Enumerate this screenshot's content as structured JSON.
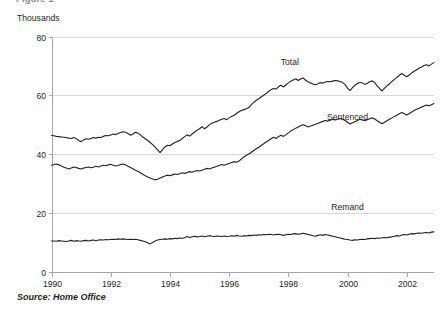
{
  "figure": {
    "title_clipped": "Figure 1",
    "unit_label": "Thousands",
    "source_note": "Source: Home Office"
  },
  "chart_data": {
    "type": "line",
    "title": "",
    "subtitle": "",
    "xlabel": "",
    "ylabel": "Thousands",
    "xlim": [
      1990.0,
      2002.92
    ],
    "ylim": [
      0,
      80
    ],
    "ytick_labels": [
      "0",
      "20",
      "40",
      "60",
      "80"
    ],
    "ytick_values": [
      0,
      20,
      40,
      60,
      80
    ],
    "xtick_labels": [
      "1990",
      "1992",
      "1994",
      "1996",
      "1998",
      "2000",
      "2002"
    ],
    "xtick_values": [
      1990,
      1992,
      1994,
      1996,
      1998,
      2000,
      2002
    ],
    "grid": "horizontal",
    "legend_position": "inline-annotation",
    "annotations": [
      {
        "label": "Total",
        "x": 1998.05,
        "y": 70.2
      },
      {
        "label": "Sentenced",
        "x": 2000.0,
        "y": 51.5
      },
      {
        "label": "Remand",
        "x": 2000.0,
        "y": 21.0
      }
    ],
    "series": [
      {
        "name": "Total",
        "x": [
          1990.0,
          1990.083,
          1990.167,
          1990.25,
          1990.333,
          1990.417,
          1990.5,
          1990.583,
          1990.667,
          1990.75,
          1990.833,
          1990.917,
          1991.0,
          1991.083,
          1991.167,
          1991.25,
          1991.333,
          1991.417,
          1991.5,
          1991.583,
          1991.667,
          1991.75,
          1991.833,
          1991.917,
          1992.0,
          1992.083,
          1992.167,
          1992.25,
          1992.333,
          1992.417,
          1992.5,
          1992.583,
          1992.667,
          1992.75,
          1992.833,
          1992.917,
          1993.0,
          1993.083,
          1993.167,
          1993.25,
          1993.333,
          1993.417,
          1993.5,
          1993.583,
          1993.667,
          1993.75,
          1993.833,
          1993.917,
          1994.0,
          1994.083,
          1994.167,
          1994.25,
          1994.333,
          1994.417,
          1994.5,
          1994.583,
          1994.667,
          1994.75,
          1994.833,
          1994.917,
          1995.0,
          1995.083,
          1995.167,
          1995.25,
          1995.333,
          1995.417,
          1995.5,
          1995.583,
          1995.667,
          1995.75,
          1995.833,
          1995.917,
          1996.0,
          1996.083,
          1996.167,
          1996.25,
          1996.333,
          1996.417,
          1996.5,
          1996.583,
          1996.667,
          1996.75,
          1996.833,
          1996.917,
          1997.0,
          1997.083,
          1997.167,
          1997.25,
          1997.333,
          1997.417,
          1997.5,
          1997.583,
          1997.667,
          1997.75,
          1997.833,
          1997.917,
          1998.0,
          1998.083,
          1998.167,
          1998.25,
          1998.333,
          1998.417,
          1998.5,
          1998.583,
          1998.667,
          1998.75,
          1998.833,
          1998.917,
          1999.0,
          1999.083,
          1999.167,
          1999.25,
          1999.333,
          1999.417,
          1999.5,
          1999.583,
          1999.667,
          1999.75,
          1999.833,
          1999.917,
          2000.0,
          2000.083,
          2000.167,
          2000.25,
          2000.333,
          2000.417,
          2000.5,
          2000.583,
          2000.667,
          2000.75,
          2000.833,
          2000.917,
          2001.0,
          2001.083,
          2001.167,
          2001.25,
          2001.333,
          2001.417,
          2001.5,
          2001.583,
          2001.667,
          2001.75,
          2001.833,
          2001.917,
          2002.0,
          2002.083,
          2002.167,
          2002.25,
          2002.333,
          2002.417,
          2002.5,
          2002.583,
          2002.667,
          2002.75,
          2002.833,
          2002.917
        ],
        "y": [
          46.3,
          46.2,
          46.0,
          45.9,
          45.8,
          45.7,
          45.6,
          45.4,
          45.3,
          45.6,
          45.3,
          44.6,
          44.2,
          44.8,
          45.2,
          45.0,
          45.3,
          45.6,
          45.4,
          45.7,
          45.6,
          46.0,
          46.3,
          46.2,
          46.5,
          46.8,
          46.6,
          47.0,
          47.3,
          47.6,
          47.4,
          47.0,
          46.4,
          46.8,
          47.4,
          47.1,
          46.5,
          45.8,
          45.2,
          44.6,
          43.9,
          43.2,
          42.3,
          41.4,
          40.5,
          41.5,
          42.4,
          43.0,
          42.8,
          43.4,
          43.9,
          44.3,
          44.6,
          45.3,
          45.9,
          46.5,
          46.1,
          46.8,
          47.5,
          48.1,
          48.6,
          49.3,
          48.6,
          49.2,
          49.9,
          50.5,
          50.8,
          51.1,
          51.5,
          51.8,
          52.1,
          51.7,
          52.3,
          52.8,
          53.2,
          53.8,
          54.4,
          54.8,
          55.1,
          55.4,
          55.8,
          56.8,
          57.6,
          58.3,
          58.8,
          59.4,
          60.0,
          60.6,
          61.3,
          61.9,
          62.3,
          62.1,
          62.9,
          63.4,
          62.8,
          63.5,
          64.2,
          64.8,
          65.2,
          65.6,
          65.0,
          65.5,
          65.9,
          65.1,
          64.6,
          64.2,
          63.8,
          63.6,
          63.9,
          64.3,
          64.1,
          64.5,
          64.7,
          64.6,
          64.8,
          65.0,
          64.9,
          64.7,
          64.3,
          63.6,
          62.4,
          61.6,
          62.6,
          63.4,
          64.0,
          64.4,
          64.2,
          63.7,
          64.1,
          64.6,
          64.9,
          64.3,
          63.2,
          62.3,
          61.5,
          62.4,
          63.2,
          63.9,
          64.7,
          65.4,
          66.1,
          66.8,
          67.4,
          66.8,
          66.3,
          66.9,
          67.6,
          68.2,
          68.7,
          69.2,
          69.6,
          70.1,
          70.4,
          70.0,
          70.6,
          71.1
        ]
      },
      {
        "name": "Sentenced",
        "x": [
          1990.0,
          1990.083,
          1990.167,
          1990.25,
          1990.333,
          1990.417,
          1990.5,
          1990.583,
          1990.667,
          1990.75,
          1990.833,
          1990.917,
          1991.0,
          1991.083,
          1991.167,
          1991.25,
          1991.333,
          1991.417,
          1991.5,
          1991.583,
          1991.667,
          1991.75,
          1991.833,
          1991.917,
          1992.0,
          1992.083,
          1992.167,
          1992.25,
          1992.333,
          1992.417,
          1992.5,
          1992.583,
          1992.667,
          1992.75,
          1992.833,
          1992.917,
          1993.0,
          1993.083,
          1993.167,
          1993.25,
          1993.333,
          1993.417,
          1993.5,
          1993.583,
          1993.667,
          1993.75,
          1993.833,
          1993.917,
          1994.0,
          1994.083,
          1994.167,
          1994.25,
          1994.333,
          1994.417,
          1994.5,
          1994.583,
          1994.667,
          1994.75,
          1994.833,
          1994.917,
          1995.0,
          1995.083,
          1995.167,
          1995.25,
          1995.333,
          1995.417,
          1995.5,
          1995.583,
          1995.667,
          1995.75,
          1995.833,
          1995.917,
          1996.0,
          1996.083,
          1996.167,
          1996.25,
          1996.333,
          1996.417,
          1996.5,
          1996.583,
          1996.667,
          1996.75,
          1996.833,
          1996.917,
          1997.0,
          1997.083,
          1997.167,
          1997.25,
          1997.333,
          1997.417,
          1997.5,
          1997.583,
          1997.667,
          1997.75,
          1997.833,
          1997.917,
          1998.0,
          1998.083,
          1998.167,
          1998.25,
          1998.333,
          1998.417,
          1998.5,
          1998.583,
          1998.667,
          1998.75,
          1998.833,
          1998.917,
          1999.0,
          1999.083,
          1999.167,
          1999.25,
          1999.333,
          1999.417,
          1999.5,
          1999.583,
          1999.667,
          1999.75,
          1999.833,
          1999.917,
          2000.0,
          2000.083,
          2000.167,
          2000.25,
          2000.333,
          2000.417,
          2000.5,
          2000.583,
          2000.667,
          2000.75,
          2000.833,
          2000.917,
          2001.0,
          2001.083,
          2001.167,
          2001.25,
          2001.333,
          2001.417,
          2001.5,
          2001.583,
          2001.667,
          2001.75,
          2001.833,
          2001.917,
          2002.0,
          2002.083,
          2002.167,
          2002.25,
          2002.333,
          2002.417,
          2002.5,
          2002.583,
          2002.667,
          2002.75,
          2002.833,
          2002.917
        ],
        "y": [
          36.2,
          36.4,
          36.6,
          36.3,
          35.9,
          35.5,
          35.2,
          34.9,
          35.2,
          35.6,
          35.4,
          35.1,
          34.9,
          35.2,
          35.4,
          35.6,
          35.3,
          35.5,
          35.8,
          35.6,
          35.9,
          36.2,
          36.0,
          36.3,
          36.5,
          36.2,
          35.9,
          36.1,
          36.4,
          36.6,
          36.3,
          35.8,
          35.4,
          35.0,
          34.5,
          34.1,
          33.6,
          33.1,
          32.6,
          32.2,
          31.8,
          31.5,
          31.2,
          31.4,
          31.8,
          32.2,
          32.5,
          32.8,
          32.6,
          32.9,
          33.2,
          33.0,
          33.3,
          33.6,
          33.4,
          33.7,
          34.0,
          33.8,
          34.1,
          34.4,
          34.2,
          34.5,
          34.8,
          35.1,
          34.9,
          35.2,
          35.5,
          35.8,
          36.1,
          36.4,
          36.2,
          36.5,
          36.8,
          37.1,
          37.4,
          37.2,
          37.6,
          38.3,
          39.0,
          39.6,
          40.0,
          40.6,
          41.2,
          41.8,
          42.3,
          42.9,
          43.5,
          44.1,
          44.6,
          45.2,
          45.7,
          45.3,
          45.9,
          46.4,
          46.0,
          46.6,
          47.2,
          47.8,
          48.3,
          48.8,
          49.2,
          49.6,
          50.0,
          49.6,
          49.2,
          49.5,
          49.8,
          50.1,
          50.4,
          50.8,
          51.1,
          51.4,
          51.2,
          51.5,
          51.8,
          51.6,
          51.9,
          52.1,
          51.8,
          51.4,
          50.8,
          50.2,
          50.6,
          51.0,
          51.4,
          51.8,
          51.6,
          51.3,
          51.7,
          52.0,
          52.3,
          51.9,
          51.3,
          50.8,
          50.3,
          50.8,
          51.3,
          51.8,
          52.3,
          52.8,
          53.2,
          53.7,
          54.1,
          53.7,
          53.3,
          53.8,
          54.3,
          54.8,
          55.2,
          55.6,
          56.0,
          56.3,
          56.7,
          56.4,
          56.8,
          57.2
        ]
      },
      {
        "name": "Remand",
        "x": [
          1990.0,
          1990.083,
          1990.167,
          1990.25,
          1990.333,
          1990.417,
          1990.5,
          1990.583,
          1990.667,
          1990.75,
          1990.833,
          1990.917,
          1991.0,
          1991.083,
          1991.167,
          1991.25,
          1991.333,
          1991.417,
          1991.5,
          1991.583,
          1991.667,
          1991.75,
          1991.833,
          1991.917,
          1992.0,
          1992.083,
          1992.167,
          1992.25,
          1992.333,
          1992.417,
          1992.5,
          1992.583,
          1992.667,
          1992.75,
          1992.833,
          1992.917,
          1993.0,
          1993.083,
          1993.167,
          1993.25,
          1993.333,
          1993.417,
          1993.5,
          1993.583,
          1993.667,
          1993.75,
          1993.833,
          1993.917,
          1994.0,
          1994.083,
          1994.167,
          1994.25,
          1994.333,
          1994.417,
          1994.5,
          1994.583,
          1994.667,
          1994.75,
          1994.833,
          1994.917,
          1995.0,
          1995.083,
          1995.167,
          1995.25,
          1995.333,
          1995.417,
          1995.5,
          1995.583,
          1995.667,
          1995.75,
          1995.833,
          1995.917,
          1996.0,
          1996.083,
          1996.167,
          1996.25,
          1996.333,
          1996.417,
          1996.5,
          1996.583,
          1996.667,
          1996.75,
          1996.833,
          1996.917,
          1997.0,
          1997.083,
          1997.167,
          1997.25,
          1997.333,
          1997.417,
          1997.5,
          1997.583,
          1997.667,
          1997.75,
          1997.833,
          1997.917,
          1998.0,
          1998.083,
          1998.167,
          1998.25,
          1998.333,
          1998.417,
          1998.5,
          1998.583,
          1998.667,
          1998.75,
          1998.833,
          1998.917,
          1999.0,
          1999.083,
          1999.167,
          1999.25,
          1999.333,
          1999.417,
          1999.5,
          1999.583,
          1999.667,
          1999.75,
          1999.833,
          1999.917,
          2000.0,
          2000.083,
          2000.167,
          2000.25,
          2000.333,
          2000.417,
          2000.5,
          2000.583,
          2000.667,
          2000.75,
          2000.833,
          2000.917,
          2001.0,
          2001.083,
          2001.167,
          2001.25,
          2001.333,
          2001.417,
          2001.5,
          2001.583,
          2001.667,
          2001.75,
          2001.833,
          2001.917,
          2002.0,
          2002.083,
          2002.167,
          2002.25,
          2002.333,
          2002.417,
          2002.5,
          2002.583,
          2002.667,
          2002.75,
          2002.833,
          2002.917
        ],
        "y": [
          10.4,
          10.4,
          10.3,
          10.5,
          10.4,
          10.3,
          10.2,
          10.4,
          10.6,
          10.3,
          10.5,
          10.4,
          10.3,
          10.5,
          10.6,
          10.4,
          10.6,
          10.7,
          10.5,
          10.7,
          10.8,
          10.7,
          10.9,
          10.8,
          10.9,
          11.0,
          10.9,
          11.1,
          11.0,
          11.1,
          11.0,
          10.9,
          11.0,
          10.9,
          11.0,
          10.8,
          10.6,
          10.4,
          10.1,
          9.8,
          9.4,
          9.9,
          10.4,
          10.7,
          10.9,
          11.0,
          11.1,
          11.0,
          11.2,
          11.1,
          11.3,
          11.2,
          11.4,
          11.3,
          11.5,
          11.9,
          11.6,
          11.8,
          12.0,
          11.8,
          11.9,
          12.1,
          11.8,
          12.0,
          12.2,
          12.0,
          11.9,
          12.1,
          12.0,
          11.9,
          12.1,
          11.9,
          12.0,
          12.2,
          12.0,
          12.3,
          12.1,
          12.0,
          12.2,
          12.1,
          12.3,
          12.2,
          12.4,
          12.3,
          12.5,
          12.4,
          12.6,
          12.5,
          12.7,
          12.6,
          12.4,
          12.6,
          12.7,
          12.5,
          12.3,
          12.5,
          12.7,
          12.6,
          12.8,
          12.9,
          12.7,
          12.8,
          13.0,
          12.8,
          12.6,
          12.4,
          12.2,
          12.0,
          12.3,
          12.5,
          12.3,
          12.6,
          12.4,
          12.2,
          12.0,
          11.8,
          11.6,
          11.4,
          11.2,
          11.0,
          10.9,
          10.7,
          10.6,
          10.8,
          10.7,
          10.9,
          11.0,
          10.9,
          11.1,
          11.2,
          11.3,
          11.2,
          11.4,
          11.3,
          11.5,
          11.6,
          11.5,
          11.7,
          11.8,
          12.0,
          12.2,
          12.1,
          12.4,
          12.6,
          12.4,
          12.7,
          12.9,
          12.8,
          13.0,
          13.1,
          13.0,
          13.2,
          13.3,
          13.1,
          13.4,
          13.5
        ]
      }
    ]
  }
}
